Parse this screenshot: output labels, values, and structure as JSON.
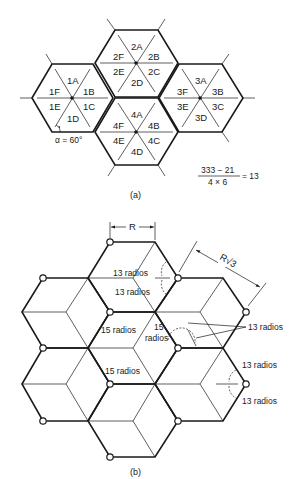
{
  "figure_a": {
    "caption": "(a)",
    "angle_label": "α = 60°",
    "equation": {
      "numerator": "333 − 21",
      "denominator": "4 × 6",
      "result": "= 13"
    },
    "cells": [
      {
        "id": "1",
        "center": [
          72,
          98
        ],
        "sectors": [
          "1A",
          "1B",
          "1C",
          "1D",
          "1E",
          "1F"
        ]
      },
      {
        "id": "2",
        "center": [
          136,
          63
        ],
        "sectors": [
          "2A",
          "2B",
          "2C",
          "2D",
          "2E",
          "2F"
        ]
      },
      {
        "id": "3",
        "center": [
          200,
          98
        ],
        "sectors": [
          "3A",
          "3B",
          "3C",
          "3D",
          "3E",
          "3F"
        ]
      },
      {
        "id": "4",
        "center": [
          136,
          132
        ],
        "sectors": [
          "4A",
          "4B",
          "4C",
          "4D",
          "4E",
          "4F"
        ]
      }
    ]
  },
  "figure_b": {
    "caption": "(b)",
    "dimension_R": "R",
    "dimension_R_sqrt3": "R√3",
    "labels": {
      "top_upper": "13 radios",
      "top_lower": "13 radios",
      "middle_left_upper": "15 radios",
      "middle_center_line1": "15",
      "middle_center_line2": "radios",
      "middle_left_lower": "15 radios",
      "right_callout": "13 radios",
      "right_upper": "13 radios",
      "right_lower": "13 radios"
    },
    "site_count": 13
  }
}
